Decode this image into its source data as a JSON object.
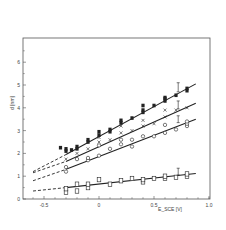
{
  "chart_data": {
    "type": "scatter",
    "title": "",
    "xlabel": "E_SCE [V]",
    "ylabel": "d [nm]",
    "xlim": [
      -0.7,
      1.0
    ],
    "ylim": [
      0,
      7
    ],
    "xticks": [
      -0.5,
      0,
      0.5,
      1.0
    ],
    "xtick_labels": [
      "-0.5",
      "0",
      "0.5",
      "1.0"
    ],
    "yticks": [
      0,
      1,
      2,
      3,
      4,
      5,
      6
    ],
    "ytick_labels": [
      "0",
      "1",
      "2",
      "3",
      "4",
      "5",
      "6"
    ],
    "grid": false,
    "legend": "none",
    "series": [
      {
        "name": "filled-squares",
        "marker": "filled-square",
        "points": [
          [
            -0.35,
            2.25
          ],
          [
            -0.3,
            2.2
          ],
          [
            -0.3,
            2.1
          ],
          [
            -0.25,
            2.15
          ],
          [
            -0.2,
            2.2
          ],
          [
            -0.2,
            2.3
          ],
          [
            -0.1,
            2.5
          ],
          [
            -0.1,
            2.6
          ],
          [
            0.0,
            2.8
          ],
          [
            0.0,
            2.95
          ],
          [
            0.1,
            2.95
          ],
          [
            0.1,
            3.05
          ],
          [
            0.2,
            3.35
          ],
          [
            0.2,
            3.45
          ],
          [
            0.3,
            3.55
          ],
          [
            0.4,
            3.8
          ],
          [
            0.4,
            3.9
          ],
          [
            0.4,
            4.1
          ],
          [
            0.5,
            4.1
          ],
          [
            0.6,
            4.3
          ],
          [
            0.6,
            4.4
          ],
          [
            0.6,
            4.45
          ],
          [
            0.7,
            4.55
          ],
          [
            0.8,
            4.75
          ],
          [
            0.8,
            4.85
          ]
        ],
        "fit_line": {
          "x_start": -0.3,
          "x_end": 0.88,
          "y_start": 1.95,
          "y_end": 5.05
        },
        "extrapolation": {
          "x_start": -0.6,
          "x_end": -0.3,
          "y_start": 1.2,
          "y_end": 1.95
        }
      },
      {
        "name": "crosses",
        "marker": "cross",
        "points": [
          [
            -0.3,
            1.75
          ],
          [
            -0.2,
            2.0
          ],
          [
            -0.1,
            2.2
          ],
          [
            0.0,
            2.5
          ],
          [
            0.0,
            2.7
          ],
          [
            0.1,
            2.6
          ],
          [
            0.2,
            2.9
          ],
          [
            0.2,
            3.2
          ],
          [
            0.3,
            3.0
          ],
          [
            0.4,
            3.2
          ],
          [
            0.4,
            3.45
          ],
          [
            0.5,
            3.3
          ],
          [
            0.6,
            3.6
          ],
          [
            0.6,
            3.9
          ],
          [
            0.7,
            3.9
          ],
          [
            0.8,
            4.0
          ]
        ],
        "fit_line": {
          "x_start": -0.3,
          "x_end": 0.88,
          "y_start": 1.65,
          "y_end": 4.2
        },
        "extrapolation": {
          "x_start": -0.6,
          "x_end": -0.3,
          "y_start": 1.15,
          "y_end": 1.65
        }
      },
      {
        "name": "open-circles",
        "marker": "open-circle",
        "points": [
          [
            -0.3,
            1.2
          ],
          [
            -0.3,
            1.4
          ],
          [
            -0.2,
            1.75
          ],
          [
            -0.1,
            1.7
          ],
          [
            -0.1,
            1.8
          ],
          [
            0.0,
            1.9
          ],
          [
            0.0,
            2.35
          ],
          [
            0.1,
            2.2
          ],
          [
            0.2,
            2.4
          ],
          [
            0.2,
            2.6
          ],
          [
            0.3,
            2.3
          ],
          [
            0.3,
            2.6
          ],
          [
            0.4,
            2.75
          ],
          [
            0.5,
            2.75
          ],
          [
            0.6,
            2.9
          ],
          [
            0.6,
            3.25
          ],
          [
            0.7,
            3.05
          ],
          [
            0.8,
            3.2
          ],
          [
            0.8,
            3.3
          ],
          [
            0.8,
            3.4
          ]
        ],
        "fit_line": {
          "x_start": -0.3,
          "x_end": 0.88,
          "y_start": 1.3,
          "y_end": 3.5
        },
        "extrapolation": {
          "x_start": -0.6,
          "x_end": -0.3,
          "y_start": 0.8,
          "y_end": 1.3
        }
      },
      {
        "name": "open-squares",
        "marker": "open-square",
        "points": [
          [
            -0.3,
            0.3
          ],
          [
            -0.3,
            0.45
          ],
          [
            -0.2,
            0.35
          ],
          [
            -0.2,
            0.65
          ],
          [
            -0.1,
            0.5
          ],
          [
            -0.1,
            0.65
          ],
          [
            0.0,
            0.85
          ],
          [
            0.1,
            0.65
          ],
          [
            0.2,
            0.8
          ],
          [
            0.3,
            0.9
          ],
          [
            0.4,
            0.75
          ],
          [
            0.4,
            0.85
          ],
          [
            0.5,
            0.9
          ],
          [
            0.6,
            0.9
          ],
          [
            0.6,
            1.0
          ],
          [
            0.7,
            0.95
          ],
          [
            0.8,
            1.0
          ],
          [
            0.8,
            1.1
          ]
        ],
        "fit_line": {
          "x_start": -0.3,
          "x_end": 0.88,
          "y_start": 0.5,
          "y_end": 1.12
        },
        "extrapolation": {
          "x_start": -0.6,
          "x_end": -0.3,
          "y_start": 0.35,
          "y_end": 0.5
        }
      }
    ],
    "error_bars": [
      {
        "series": "filled-squares",
        "x": 0.72,
        "y_low": 4.7,
        "y_high": 5.1
      },
      {
        "series": "crosses",
        "x": 0.72,
        "y_low": 3.95,
        "y_high": 4.3
      },
      {
        "series": "open-circles",
        "x": 0.72,
        "y_low": 3.35,
        "y_high": 3.65
      },
      {
        "series": "open-squares",
        "x": 0.72,
        "y_low": 1.05,
        "y_high": 1.35
      }
    ],
    "plot_frame_px": {
      "left": 23,
      "right": 210,
      "top": 38,
      "bottom": 199
    },
    "colors": {
      "ink": "#222222",
      "frame": "#555555",
      "background": "#ffffff"
    }
  }
}
